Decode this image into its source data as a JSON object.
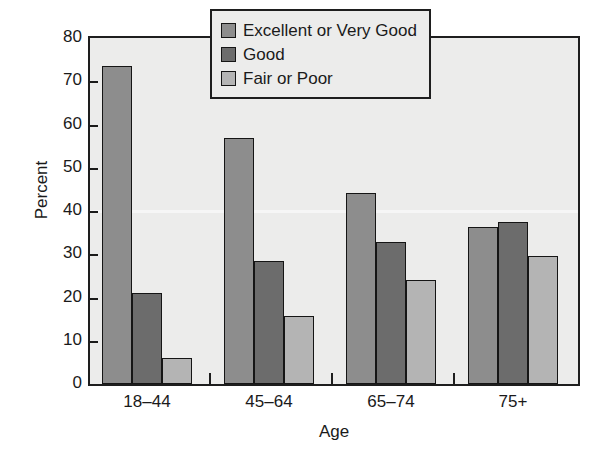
{
  "chart_data": {
    "type": "bar",
    "title": "",
    "xlabel": "Age",
    "ylabel": "Percent",
    "categories": [
      "18–44",
      "45–64",
      "65–74",
      "75+"
    ],
    "series": [
      {
        "name": "Excellent or Very Good",
        "color": "#8d8d8d",
        "values": [
          73.5,
          56.8,
          44.2,
          36.4
        ]
      },
      {
        "name": "Good",
        "color": "#6c6c6c",
        "values": [
          21.0,
          28.4,
          32.8,
          37.5
        ]
      },
      {
        "name": "Fair or Poor",
        "color": "#b4b4b4",
        "values": [
          6.1,
          15.8,
          24.1,
          29.5
        ]
      }
    ],
    "ylim": [
      0,
      80
    ],
    "yticks": [
      0,
      10,
      20,
      30,
      40,
      50,
      60,
      70,
      80
    ],
    "ytick_labels": [
      "0",
      "10",
      "20",
      "30",
      "40",
      "50",
      "60",
      "70",
      "80"
    ],
    "grid": false,
    "legend_position": "top-center",
    "plot_background": "#ececeb",
    "axis_color": "#1e1e1e"
  }
}
